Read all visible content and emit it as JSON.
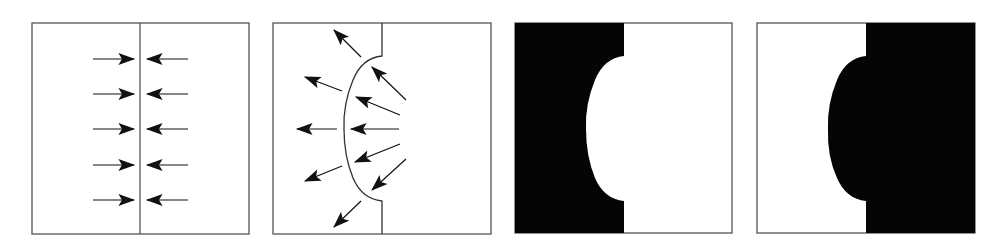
{
  "figure": {
    "colors": {
      "ink": "#111111",
      "frame": "#555555",
      "fill": "#050505",
      "background": "#ffffff"
    },
    "panels": [
      {
        "id": "panel-1",
        "label": "flat-interface-with-converging-arrows",
        "arrow_count": 10
      },
      {
        "id": "panel-2",
        "label": "curved-interface-with-diverging-arrows",
        "arrow_count": 10
      },
      {
        "id": "panel-3",
        "label": "left-region-filled-bulge-cut-into-black"
      },
      {
        "id": "panel-4",
        "label": "right-region-filled-bulge-protruding-left"
      }
    ]
  }
}
